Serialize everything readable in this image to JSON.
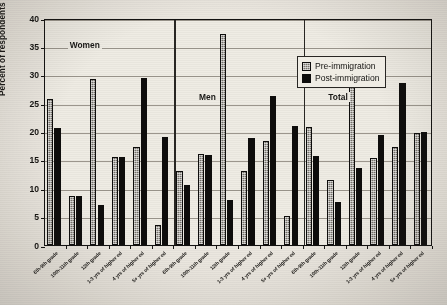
{
  "chart_data": {
    "type": "bar",
    "title": "",
    "xlabel": "",
    "ylabel": "Percent of respondents",
    "ylim": [
      0,
      40
    ],
    "ytick_step": 5,
    "yticks": [
      "0",
      "5",
      "10",
      "15",
      "20",
      "25",
      "30",
      "35",
      "40"
    ],
    "grid": true,
    "legend_position": "top-right-inside",
    "panels": [
      "Women",
      "Men",
      "Total"
    ],
    "categories": [
      "6th-9th grade",
      "10th-11th grade",
      "12th grade",
      "1-3 yrs of higher ed",
      "4 yrs of higher ed",
      "5+ yrs of higher ed",
      "6th-9th grade",
      "10th-11th grade",
      "12th grade",
      "1-3 yrs of higher ed",
      "4 yrs of higher ed",
      "5+ yrs of higher ed",
      "6th-9th grade",
      "10th-11th grade",
      "12th grade",
      "1-3 yrs of higher ed",
      "4 yrs of higher ed",
      "5+ yrs of higher ed"
    ],
    "series": [
      {
        "name": "Pre-immigration",
        "color": "#77736c",
        "values": [
          25.8,
          8.7,
          29.3,
          15.5,
          17.2,
          3.5,
          13.0,
          16.0,
          37.2,
          13.0,
          18.4,
          5.2,
          20.8,
          11.4,
          32.4,
          15.3,
          17.2,
          19.8
        ]
      },
      {
        "name": "Post-immigration",
        "color": "#100f0e",
        "values": [
          20.7,
          8.7,
          7.0,
          15.5,
          29.4,
          19.1,
          10.5,
          15.9,
          8.0,
          18.8,
          26.2,
          21.0,
          15.6,
          7.6,
          13.6,
          19.4,
          28.5,
          19.9
        ]
      }
    ]
  },
  "axis": {
    "y_title": "Percent of respondents",
    "ticks": [
      "40",
      "35",
      "30",
      "25",
      "20",
      "15",
      "10",
      "5",
      "0"
    ]
  },
  "legend": {
    "items": [
      {
        "label": "Pre-immigration",
        "style": "pre"
      },
      {
        "label": "Post-immigration",
        "style": "post"
      }
    ]
  },
  "panels": [
    {
      "label": "Women"
    },
    {
      "label": "Men"
    },
    {
      "label": "Total"
    }
  ]
}
